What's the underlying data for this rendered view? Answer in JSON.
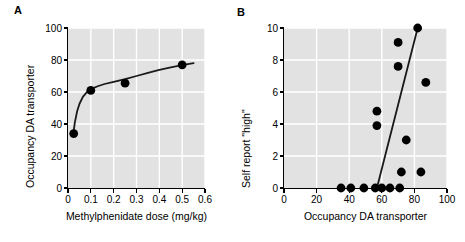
{
  "figure": {
    "panels": [
      {
        "letter": "A",
        "chart_type": "scatter",
        "xlabel": "Methylphenidate dose (mg/kg)",
        "ylabel": "Occupancy DA transporter",
        "xticks": [
          "0",
          "0.1",
          "0.2",
          "0.3",
          "0.4",
          "0.5",
          "0.6"
        ],
        "yticks": [
          "0",
          "20",
          "40",
          "60",
          "80",
          "100"
        ]
      },
      {
        "letter": "B",
        "chart_type": "scatter",
        "xlabel": "Occupancy DA transporter",
        "ylabel": "Self report \"high\"",
        "xticks": [
          "0",
          "20",
          "40",
          "60",
          "80",
          "100"
        ],
        "yticks": [
          "0",
          "2",
          "4",
          "6",
          "8",
          "10"
        ]
      }
    ]
  },
  "chart_data": [
    {
      "type": "scatter",
      "panel": "A",
      "title": "",
      "xlabel": "Methylphenidate dose (mg/kg)",
      "ylabel": "Occupancy DA transporter",
      "xlim": [
        0,
        0.6
      ],
      "ylim": [
        0,
        100
      ],
      "xticks": [
        0,
        0.1,
        0.2,
        0.3,
        0.4,
        0.5,
        0.6
      ],
      "yticks": [
        0,
        20,
        40,
        60,
        80,
        100
      ],
      "grid": true,
      "legend": false,
      "marker_color": "#000000",
      "line_color": "#1a1a1a",
      "points": [
        {
          "x": 0.025,
          "y": 34
        },
        {
          "x": 0.1,
          "y": 61
        },
        {
          "x": 0.25,
          "y": 65.5
        },
        {
          "x": 0.5,
          "y": 77
        }
      ],
      "fit_curve": {
        "kind": "hyperbolic",
        "points": [
          {
            "x": 0.022,
            "y": 32.5
          },
          {
            "x": 0.03,
            "y": 41
          },
          {
            "x": 0.04,
            "y": 48
          },
          {
            "x": 0.05,
            "y": 52.5
          },
          {
            "x": 0.065,
            "y": 57
          },
          {
            "x": 0.08,
            "y": 59.5
          },
          {
            "x": 0.1,
            "y": 61.8
          },
          {
            "x": 0.13,
            "y": 63.6
          },
          {
            "x": 0.16,
            "y": 65
          },
          {
            "x": 0.2,
            "y": 66.4
          },
          {
            "x": 0.25,
            "y": 68
          },
          {
            "x": 0.3,
            "y": 70
          },
          {
            "x": 0.35,
            "y": 72
          },
          {
            "x": 0.4,
            "y": 73.8
          },
          {
            "x": 0.45,
            "y": 75.4
          },
          {
            "x": 0.5,
            "y": 76.8
          },
          {
            "x": 0.55,
            "y": 78
          }
        ]
      }
    },
    {
      "type": "scatter",
      "panel": "B",
      "title": "",
      "xlabel": "Occupancy DA transporter",
      "ylabel": "Self report \"high\"",
      "xlim": [
        0,
        100
      ],
      "ylim": [
        0,
        10
      ],
      "xticks": [
        0,
        20,
        40,
        60,
        80,
        100
      ],
      "yticks": [
        0,
        2,
        4,
        6,
        8,
        10
      ],
      "grid": true,
      "legend": false,
      "marker_color": "#000000",
      "line_color": "#1a1a1a",
      "points": [
        {
          "x": 35,
          "y": 0
        },
        {
          "x": 41,
          "y": 0
        },
        {
          "x": 49,
          "y": 0
        },
        {
          "x": 56,
          "y": 0
        },
        {
          "x": 60,
          "y": 0
        },
        {
          "x": 65,
          "y": 0
        },
        {
          "x": 71,
          "y": 0
        },
        {
          "x": 72,
          "y": 1
        },
        {
          "x": 84,
          "y": 1
        },
        {
          "x": 75,
          "y": 3
        },
        {
          "x": 57,
          "y": 3.9
        },
        {
          "x": 57,
          "y": 4.8
        },
        {
          "x": 87,
          "y": 6.6
        },
        {
          "x": 70,
          "y": 7.6
        },
        {
          "x": 70,
          "y": 9.1
        },
        {
          "x": 82,
          "y": 10
        }
      ],
      "fit_line": {
        "kind": "linear",
        "x0": 57,
        "y0": 0,
        "x1": 82,
        "y1": 10
      }
    }
  ]
}
